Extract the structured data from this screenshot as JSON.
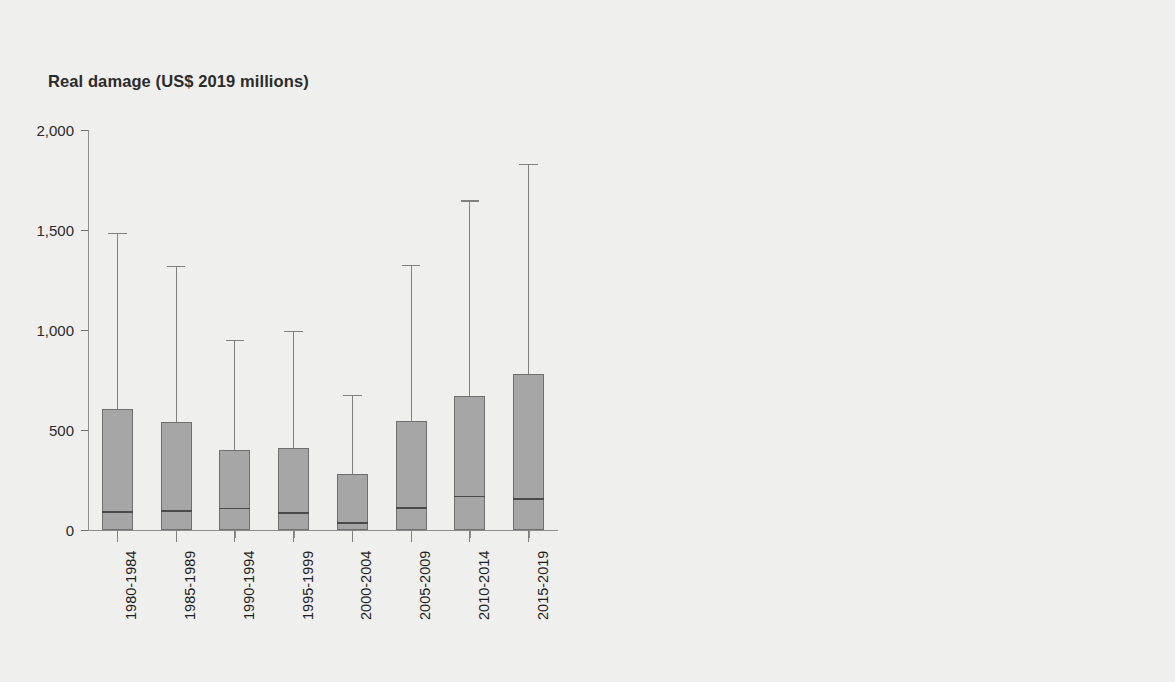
{
  "figure": {
    "background_color": "#efefed",
    "panels": [
      {
        "id": "left",
        "title": "Real damage (US$ 2019 millions)",
        "box_fill_color": "#a6a6a6"
      },
      {
        "id": "right",
        "title": "Affected people (thousands)",
        "box_fill_color": "#131313"
      }
    ]
  },
  "chart_data": [
    {
      "type": "box",
      "title": "Real damage (US$ 2019 millions)",
      "xlabel": "",
      "ylabel": "Real damage (US$ 2019 millions)",
      "ylim": [
        0,
        2000
      ],
      "yticks": [
        0,
        500,
        1000,
        1500,
        2000
      ],
      "ytick_labels": [
        "0",
        "500",
        "1,000",
        "1,500",
        "2,000"
      ],
      "grid": false,
      "legend": "none",
      "categories": [
        "1980-1984",
        "1985-1989",
        "1990-1994",
        "1995-1999",
        "2000-2004",
        "2005-2009",
        "2010-2014",
        "2015-2019"
      ],
      "boxes": [
        {
          "category": "1980-1984",
          "whisker_low": 0,
          "q1": 0,
          "median": 95,
          "q3": 605,
          "whisker_high": 1485
        },
        {
          "category": "1985-1989",
          "whisker_low": 0,
          "q1": 0,
          "median": 98,
          "q3": 542,
          "whisker_high": 1320
        },
        {
          "category": "1990-1994",
          "whisker_low": 0,
          "q1": 0,
          "median": 112,
          "q3": 400,
          "whisker_high": 950
        },
        {
          "category": "1995-1999",
          "whisker_low": 0,
          "q1": 0,
          "median": 90,
          "q3": 408,
          "whisker_high": 995
        },
        {
          "category": "2000-2004",
          "whisker_low": 0,
          "q1": 0,
          "median": 40,
          "q3": 282,
          "whisker_high": 675
        },
        {
          "category": "2005-2009",
          "whisker_low": 0,
          "q1": 0,
          "median": 115,
          "q3": 543,
          "whisker_high": 1325
        },
        {
          "category": "2010-2014",
          "whisker_low": 0,
          "q1": 0,
          "median": 172,
          "q3": 668,
          "whisker_high": 1648
        },
        {
          "category": "2015-2019",
          "whisker_low": 0,
          "q1": 0,
          "median": 160,
          "q3": 782,
          "whisker_high": 1832
        }
      ]
    },
    {
      "type": "box",
      "title": "Affected people (thousands)",
      "xlabel": "",
      "ylabel": "Affected people (thousands)",
      "ylim": [
        0,
        400
      ],
      "yticks": [
        0,
        100,
        200,
        300,
        400
      ],
      "ytick_labels": [
        "0",
        "100",
        "200",
        "300",
        "400"
      ],
      "grid": false,
      "legend": "none",
      "categories": [
        "1980-1984",
        "1985-1989",
        "1990-1994",
        "1995-1999",
        "2000-2004",
        "2005-2009",
        "2010-2014",
        "2015-2019"
      ],
      "boxes": [
        {
          "category": "1980-1984",
          "whisker_low": 0,
          "q1": 0,
          "median": 20,
          "q3": 160,
          "whisker_high": 352
        },
        {
          "category": "1985-1989",
          "whisker_low": 0,
          "q1": 0,
          "median": 7,
          "q3": 127,
          "whisker_high": 311
        },
        {
          "category": "1990-1994",
          "whisker_low": 0,
          "q1": 0,
          "median": 12,
          "q3": 141,
          "whisker_high": 352
        },
        {
          "category": "1995-1999",
          "whisker_low": 0,
          "q1": 0,
          "median": 2,
          "q3": 51,
          "whisker_high": 126
        },
        {
          "category": "2000-2004",
          "whisker_low": 0,
          "q1": 0,
          "median": 1,
          "q3": 19,
          "whisker_high": 47
        },
        {
          "category": "2005-2009",
          "whisker_low": 0,
          "q1": 0,
          "median": 3,
          "q3": 50,
          "whisker_high": 122
        },
        {
          "category": "2010-2014",
          "whisker_low": 0,
          "q1": 0,
          "median": 8,
          "q3": 86,
          "whisker_high": 217
        },
        {
          "category": "2015-2019",
          "whisker_low": 0,
          "q1": 0,
          "median": 3,
          "q3": 54,
          "whisker_high": 130
        }
      ]
    }
  ]
}
